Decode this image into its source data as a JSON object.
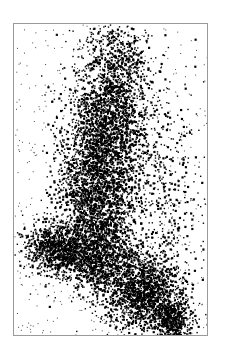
{
  "chart_data": {
    "type": "scatter",
    "title": "",
    "xlabel": "",
    "ylabel": "",
    "legend": [],
    "grid": false,
    "axes_visible": false,
    "frame": {
      "x": 13,
      "y": 23,
      "width": 195,
      "height": 313,
      "border_color": "#9a9a9a"
    },
    "point_color": "#000000",
    "background": "#ffffff",
    "clusters": [
      {
        "name": "top-plume",
        "cx": 0.52,
        "cy": 0.12,
        "sx": 0.09,
        "sy": 0.08,
        "weight": 0.08
      },
      {
        "name": "upper-column",
        "cx": 0.48,
        "cy": 0.32,
        "sx": 0.11,
        "sy": 0.09,
        "weight": 0.16
      },
      {
        "name": "mid-column",
        "cx": 0.42,
        "cy": 0.52,
        "sx": 0.1,
        "sy": 0.1,
        "weight": 0.2
      },
      {
        "name": "lower-left-foot",
        "cx": 0.22,
        "cy": 0.72,
        "sx": 0.08,
        "sy": 0.04,
        "weight": 0.1
      },
      {
        "name": "elbow",
        "cx": 0.42,
        "cy": 0.74,
        "sx": 0.1,
        "sy": 0.06,
        "weight": 0.14
      },
      {
        "name": "lower-right-arm",
        "cx": 0.66,
        "cy": 0.86,
        "sx": 0.1,
        "sy": 0.06,
        "weight": 0.18
      },
      {
        "name": "bottom-right-tip",
        "cx": 0.82,
        "cy": 0.95,
        "sx": 0.05,
        "sy": 0.04,
        "weight": 0.06
      },
      {
        "name": "right-scatter",
        "cx": 0.7,
        "cy": 0.55,
        "sx": 0.16,
        "sy": 0.18,
        "weight": 0.08
      }
    ]
  }
}
